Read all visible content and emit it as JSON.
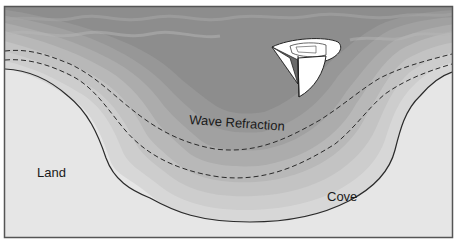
{
  "diagram": {
    "labels": {
      "wave_refraction": "Wave Refraction",
      "land": "Land",
      "cove": "Cove"
    },
    "colors": {
      "land": "#e6e6e6",
      "frame": "#555555",
      "water_bands": [
        "#8f8f8f",
        "#9b9b9b",
        "#a6a6a6",
        "#b1b1b1",
        "#bcbcbc",
        "#c6c6c6",
        "#d0d0d0",
        "#d9d9d9"
      ],
      "shoreline": "#2a2a2a",
      "dashed_lines": "#2a2a2a",
      "boat_sail": "#ffffff"
    },
    "elements": {
      "boat": "sailboat-icon",
      "shoreline": "solid line",
      "wave_fronts": "two dashed lines"
    }
  }
}
